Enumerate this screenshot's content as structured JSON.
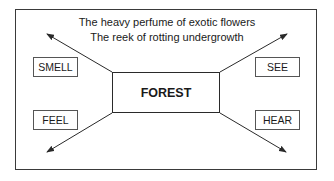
{
  "diagram": {
    "center": {
      "label": "FOREST"
    },
    "caption_lines": [
      "The heavy perfume of exotic flowers",
      "The reek of rotting undergrowth"
    ],
    "senses": [
      {
        "label": "SMELL",
        "position": "top-left"
      },
      {
        "label": "SEE",
        "position": "top-right"
      },
      {
        "label": "FEEL",
        "position": "bottom-left"
      },
      {
        "label": "HEAR",
        "position": "bottom-right"
      }
    ],
    "colors": {
      "line": "#2a2a2a",
      "box_border": "#555555",
      "background": "#ffffff"
    }
  }
}
